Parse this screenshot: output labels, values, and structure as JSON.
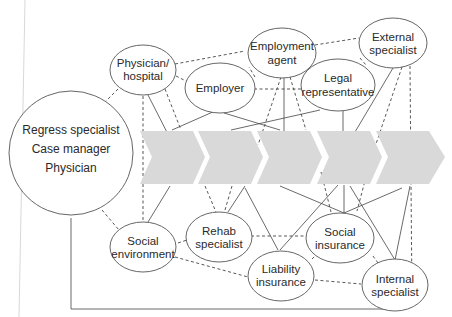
{
  "diagram": {
    "type": "stakeholder-network",
    "colors": {
      "chevron_fill": "#d9d9d9",
      "line": "#444444",
      "node_stroke": "#555555",
      "text": "#2a2a2a"
    },
    "central_node": {
      "lines": [
        "Regress specialist",
        "Case manager",
        "Physician"
      ]
    },
    "process_chevrons": {
      "count": 5
    },
    "nodes": {
      "physician_hospital": {
        "line1": "Physician/",
        "line2": "hospital"
      },
      "employer": {
        "line1": "Employer"
      },
      "employment_agent": {
        "line1": "Employment",
        "line2": "agent"
      },
      "legal_representative": {
        "line1": "Legal",
        "line2": "representative"
      },
      "external_specialist": {
        "line1": "External",
        "line2": "specialist"
      },
      "social_environment": {
        "line1": "Social",
        "line2": "environment"
      },
      "rehab_specialist": {
        "line1": "Rehab",
        "line2": "specialist"
      },
      "liability_insurance": {
        "line1": "Liability",
        "line2": "insurance"
      },
      "social_insurance": {
        "line1": "Social",
        "line2": "insurance"
      },
      "internal_specialist": {
        "line1": "Internal",
        "line2": "specialist"
      }
    },
    "legend_note": {
      "solid_line": "direct connection",
      "dashed_line": "indirect connection"
    }
  }
}
